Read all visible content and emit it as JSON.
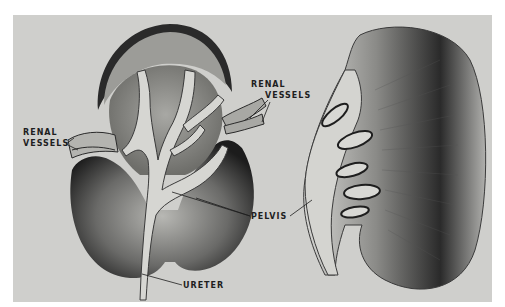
{
  "figure": {
    "background_color": "#cfcfcc",
    "ink_color": "#1e1e1e",
    "left_view": {
      "description": "Kidney cut open showing renal pelvis branching into calyces",
      "labels": {
        "renal_vessels_left": {
          "line1": "RENAL",
          "line2": "VESSELS"
        },
        "renal_vessels_right": {
          "line1": "RENAL",
          "line2": "VESSELS"
        },
        "ureter": "URETER"
      }
    },
    "shared_labels": {
      "pelvis": "PELVIS"
    },
    "right_view": {
      "description": "Kidney in longitudinal section showing pyramids and calyces"
    }
  }
}
